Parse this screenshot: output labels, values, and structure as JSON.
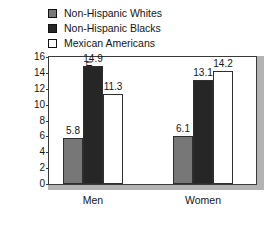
{
  "chart_data": {
    "type": "bar",
    "title": "",
    "subtitle": "",
    "xlabel": "",
    "ylabel": "Percent of Population",
    "categories": [
      "Men",
      "Women"
    ],
    "ylim": [
      0,
      16
    ],
    "yticks": [
      0,
      2,
      4,
      6,
      8,
      10,
      12,
      14,
      16
    ],
    "ytick_labels": [
      "0",
      "2",
      "4",
      "6",
      "8",
      "10",
      "12",
      "14",
      "16"
    ],
    "grid": false,
    "legend_position": "top-left",
    "series": [
      {
        "name": "Non-Hispanic Whites",
        "color": "#777777",
        "values": [
          5.8,
          6.1
        ],
        "value_labels": [
          "5.8",
          "6.1"
        ]
      },
      {
        "name": "Non-Hispanic Blacks",
        "color": "#262626",
        "values": [
          14.9,
          13.1
        ],
        "value_labels": [
          "14.9",
          "13.1"
        ]
      },
      {
        "name": "Mexican Americans",
        "color": "#ffffff",
        "values": [
          11.3,
          14.2
        ],
        "value_labels": [
          "11.3",
          "14.2"
        ]
      }
    ]
  },
  "legend": {
    "items": [
      {
        "label": "Non-Hispanic Whites",
        "swatch": "#777777"
      },
      {
        "label": "Non-Hispanic Blacks",
        "swatch": "#262626"
      },
      {
        "label": "Mexican Americans",
        "swatch": "#ffffff"
      }
    ]
  }
}
